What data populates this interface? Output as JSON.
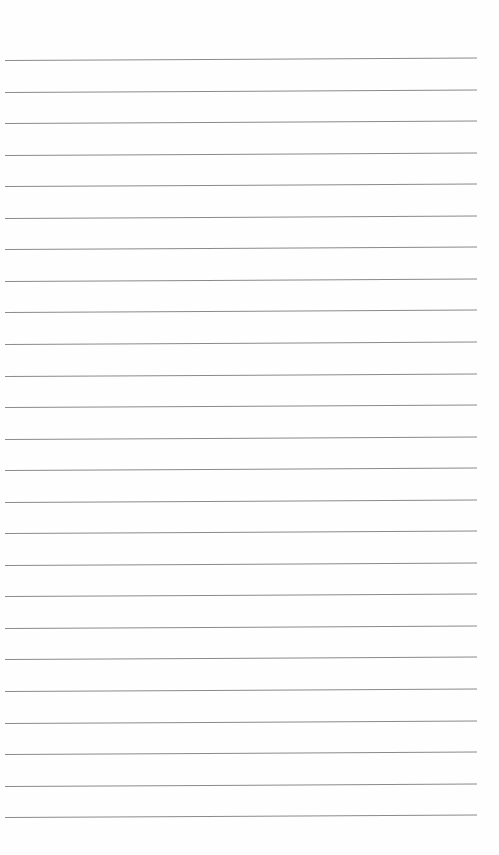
{
  "document": {
    "type": "lined-paper",
    "line_count": 25,
    "first_line_y": 60,
    "line_spacing": 31.55,
    "line_color": "#8a8a8a",
    "background_color": "#fefefe",
    "text": ""
  }
}
